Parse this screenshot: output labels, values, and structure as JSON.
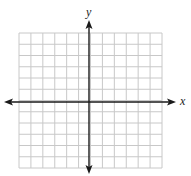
{
  "diagram": {
    "type": "coordinate-plane",
    "x_axis_label": "x",
    "y_axis_label": "y",
    "grid": {
      "left": 19,
      "top": 33,
      "right": 162,
      "bottom": 168,
      "columns": 12,
      "rows": 12,
      "line_color": "#c8c8c8"
    },
    "origin": {
      "x": 89,
      "y": 102
    },
    "axis_color": "#1a1a1a",
    "x_axis_extent": [
      4,
      176
    ],
    "y_axis_extent": [
      20,
      174
    ]
  }
}
